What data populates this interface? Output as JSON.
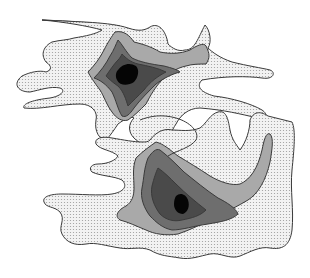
{
  "figure": {
    "type": "contour-density-diagram",
    "peaks": 2,
    "levels": [
      {
        "name": "level-1-outer",
        "fill": "#e6e6e6",
        "pattern": "stipple"
      },
      {
        "name": "level-2",
        "fill": "#a9a9a9"
      },
      {
        "name": "level-3",
        "fill": "#6e6e6e"
      },
      {
        "name": "level-4",
        "fill": "#4a4a4a"
      },
      {
        "name": "level-5-core",
        "fill": "#050505"
      }
    ],
    "colors": {
      "background": "#ffffff",
      "outline": "#3a3a3a",
      "stipple_dot": "#9a9a9a"
    }
  }
}
